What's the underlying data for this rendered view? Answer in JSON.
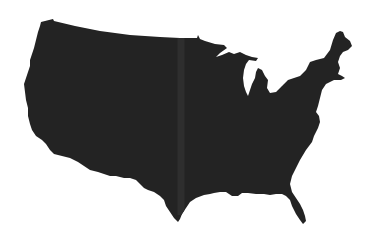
{
  "map": {
    "subject": "Contiguous United States silhouette",
    "style": "solid filled silhouette, no labels",
    "colors": {
      "background": "#ffffff",
      "land_fill": "#232323",
      "seam": "#2e2e2e"
    },
    "outline_points": "41,22 53,19 54,21 75,26 100,31 130,35 160,37 180,38 197,38 198,35 200,39 205,41 215,44 224,45 227,48 220,53 216,57 222,55 229,52 234,54 240,52 246,55 252,57 258,58 256,61 249,60 246,64 244,70 243,78 244,86 246,92 248,96 250,90 252,84 255,78 256,72 258,68 262,70 265,76 268,80 267,88 270,93 276,92 282,86 288,80 294,78 300,76 306,70 310,62 316,60 324,58 330,50 333,40 336,33 340,31 343,32 345,37 350,41 352,46 348,50 343,52 340,56 338,62 340,68 338,74 342,76 345,78 341,80 334,80 326,84 322,90 320,98 318,106 316,112 319,116 320,122 318,128 314,136 312,142 306,150 300,160 296,168 292,176 290,184 292,192 296,198 300,204 303,210 305,216 306,221 303,224 300,220 296,214 292,206 290,200 286,196 282,194 276,194 270,195 264,194 256,194 248,193 242,193 238,196 232,196 226,192 220,192 214,193 210,194 204,195 196,198 190,202 186,208 182,214 180,219 178,222 174,218 170,212 166,206 164,200 160,196 154,192 148,190 144,188 140,184 136,180 130,178 124,178 116,176 110,176 104,174 98,172 90,170 84,166 78,162 70,158 62,156 54,154 50,150 46,144 42,140 36,136 32,130 30,124 28,116 28,108 26,100 25,92 24,84 26,78 28,72 30,66 30,60 32,54 34,48 36,40 38,32 40,26",
    "seam": {
      "x": 181,
      "y_top": 38,
      "y_bottom": 215,
      "width": 7
    }
  }
}
